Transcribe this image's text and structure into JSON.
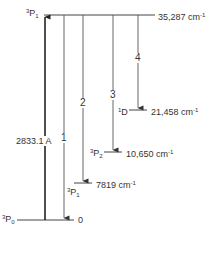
{
  "diagram": {
    "title": "",
    "type": "energy-level-diagram",
    "levels": [
      {
        "term_sup": "3",
        "term_base": "P",
        "term_sub": "1",
        "energy": "35,287 cm",
        "unit_sup": "-1",
        "position": "top"
      },
      {
        "term_sup": "1",
        "term_base": "D",
        "term_sub": "",
        "energy": "21,458 cm",
        "unit_sup": "-1"
      },
      {
        "term_sup": "3",
        "term_base": "P",
        "term_sub": "2",
        "energy": "10,650 cm",
        "unit_sup": "-1"
      },
      {
        "term_sup": "3",
        "term_base": "P",
        "term_sub": "1",
        "energy": "7819 cm",
        "unit_sup": "-1"
      },
      {
        "term_sup": "3",
        "term_base": "P",
        "term_sub": "0",
        "energy": "0",
        "unit_sup": "",
        "position": "ground"
      }
    ],
    "excitation": {
      "label": "2833.1 A",
      "from": "3P0",
      "to": "3P1 (35,287)"
    },
    "transitions": [
      {
        "label": "1",
        "to": "3P0 (0)"
      },
      {
        "label": "2",
        "to": "3P1 (7819)"
      },
      {
        "label": "3",
        "to": "3P2 (10,650)"
      },
      {
        "label": "4",
        "to": "1D (21,458)"
      }
    ],
    "line_color": "#333333"
  }
}
